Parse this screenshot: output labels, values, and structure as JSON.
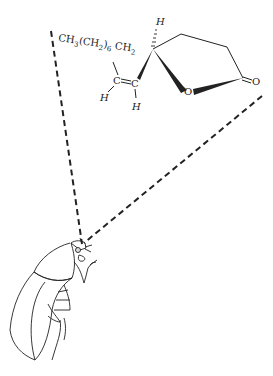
{
  "figure": {
    "molecule": {
      "chain_label": "CH3(CH2)6 CH2",
      "chain_label_parts": {
        "a": "CH",
        "a_sub": "3",
        "b": "(CH",
        "b_sub": "2",
        "c": ")",
        "c_sub": "6",
        "d": " CH",
        "d_sub": "2"
      },
      "atoms": {
        "vinyl_c1": "C",
        "vinyl_c2": "C",
        "h_vinyl_1": "H",
        "h_vinyl_2": "H",
        "h_stereo": "H",
        "ring_oxygen": "O",
        "carbonyl_oxygen": "O"
      }
    },
    "colors": {
      "line": "#222222",
      "background": "#ffffff"
    }
  }
}
